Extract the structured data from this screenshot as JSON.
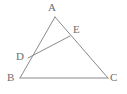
{
  "figure": {
    "kind": "geometry-diagram",
    "width": 127,
    "height": 94,
    "background_color": "#ffffff",
    "stroke_color": "#8a8a8a",
    "label_color": "#6d6d6d",
    "stroke_width": 1
  },
  "labels": {
    "a": "A",
    "b": "B",
    "c": "C",
    "d": "D",
    "e": "E"
  },
  "points": {
    "A": {
      "x": 55,
      "y": 17
    },
    "B": {
      "x": 20,
      "y": 78
    },
    "C": {
      "x": 108,
      "y": 78
    },
    "D": {
      "x": 28,
      "y": 58
    },
    "E": {
      "x": 70,
      "y": 36
    }
  },
  "label_positions": {
    "A": {
      "x": 48,
      "y": 2
    },
    "B": {
      "x": 7,
      "y": 72
    },
    "C": {
      "x": 110,
      "y": 72
    },
    "D": {
      "x": 16,
      "y": 51
    },
    "E": {
      "x": 73,
      "y": 24
    }
  },
  "segments": [
    {
      "name": "AB",
      "from": "A",
      "to": "B"
    },
    {
      "name": "BC",
      "from": "B",
      "to": "C"
    },
    {
      "name": "CA",
      "from": "C",
      "to": "A"
    },
    {
      "name": "DE",
      "from": "D",
      "to": "E"
    }
  ],
  "chart_data": {
    "type": "diagram",
    "title": "",
    "vertices": [
      {
        "label": "A",
        "x": 55,
        "y": 17,
        "role": "triangle-apex"
      },
      {
        "label": "B",
        "x": 20,
        "y": 78,
        "role": "triangle-vertex"
      },
      {
        "label": "C",
        "x": 108,
        "y": 78,
        "role": "triangle-vertex"
      },
      {
        "label": "D",
        "x": 28,
        "y": 58,
        "role": "point-on-segment-AB"
      },
      {
        "label": "E",
        "x": 70,
        "y": 36,
        "role": "point-on-segment-AC"
      }
    ],
    "edges": [
      "A-B",
      "B-C",
      "C-A",
      "D-E"
    ]
  }
}
